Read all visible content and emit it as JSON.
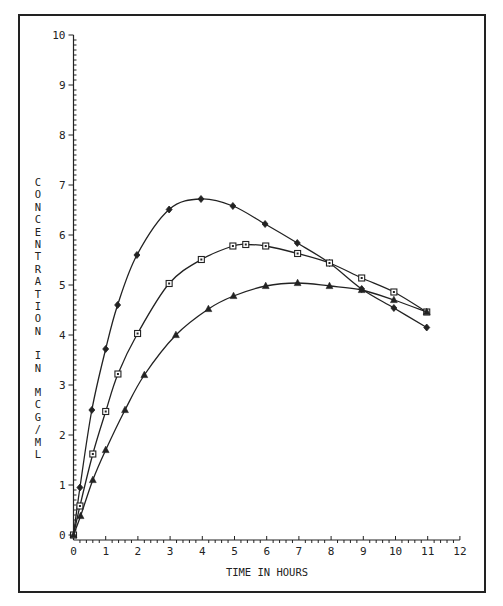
{
  "chart_data": {
    "type": "line",
    "title": "",
    "xlabel": "TIME IN HOURS",
    "ylabel": "CONCENTRATION IN MCG/ML",
    "xlim": [
      0,
      12
    ],
    "ylim": [
      0,
      10
    ],
    "x_ticks": [
      0,
      1,
      2,
      3,
      4,
      5,
      6,
      7,
      8,
      9,
      10,
      11,
      12
    ],
    "y_ticks": [
      0,
      1,
      2,
      3,
      4,
      5,
      6,
      7,
      8,
      9,
      10
    ],
    "grid": false,
    "legend": null,
    "series": [
      {
        "name": "diamond",
        "marker": "diamond",
        "x": [
          0,
          0.2,
          0.57,
          1.0,
          1.37,
          1.97,
          2.97,
          3.96,
          4.95,
          5.95,
          6.95,
          7.95,
          8.95,
          9.95,
          10.97
        ],
        "y": [
          0,
          0.95,
          2.5,
          3.72,
          4.6,
          5.6,
          6.51,
          6.72,
          6.58,
          6.22,
          5.84,
          5.44,
          4.92,
          4.54,
          4.15
        ]
      },
      {
        "name": "square",
        "marker": "square",
        "x": [
          0,
          0.2,
          0.6,
          1.0,
          1.38,
          1.99,
          2.97,
          3.97,
          4.95,
          5.35,
          5.97,
          6.96,
          7.95,
          8.95,
          9.95,
          10.97
        ],
        "y": [
          0,
          0.58,
          1.62,
          2.47,
          3.22,
          4.03,
          5.03,
          5.51,
          5.78,
          5.81,
          5.78,
          5.63,
          5.44,
          5.14,
          4.86,
          4.46
        ]
      },
      {
        "name": "triangle",
        "marker": "triangle",
        "x": [
          0,
          0.22,
          0.6,
          1.0,
          1.6,
          2.2,
          3.18,
          4.19,
          4.97,
          5.97,
          6.96,
          7.95,
          8.95,
          9.95,
          10.97
        ],
        "y": [
          0,
          0.38,
          1.1,
          1.7,
          2.5,
          3.2,
          4.0,
          4.52,
          4.78,
          4.98,
          5.04,
          4.98,
          4.9,
          4.7,
          4.46
        ]
      }
    ]
  },
  "colors": {
    "ink": "#222222",
    "background": "#ffffff"
  }
}
